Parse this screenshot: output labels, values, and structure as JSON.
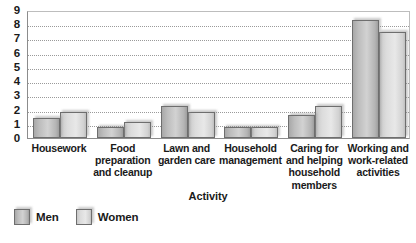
{
  "chart_data": {
    "type": "bar",
    "title": "",
    "subtitle": "",
    "xlabel": "Activity",
    "ylabel": "",
    "ylim": [
      0,
      9
    ],
    "ytick_labels": [
      "9",
      "8",
      "7",
      "6",
      "5",
      "4",
      "3",
      "2",
      "1",
      "0"
    ],
    "yticks": [
      9,
      8,
      7,
      6,
      5,
      4,
      3,
      2,
      1,
      0
    ],
    "grid": true,
    "grid_axis": "y",
    "grid_style": "dotted",
    "legend_position": "below-left",
    "categories": [
      "Housework",
      "Food preparation and cleanup",
      "Lawn and garden care",
      "Household management",
      "Caring for and helping household members",
      "Working and work-related activities"
    ],
    "category_label_lines": [
      [
        "Housework"
      ],
      [
        "Food",
        "preparation",
        "and cleanup"
      ],
      [
        "Lawn and",
        "garden care"
      ],
      [
        "Household",
        "management"
      ],
      [
        "Caring for",
        "and helping",
        "household",
        "members"
      ],
      [
        "Working and",
        "work-related",
        "activities"
      ]
    ],
    "series": [
      {
        "name": "Men",
        "color": "#bdbdbd",
        "values": [
          1.4,
          0.75,
          2.25,
          0.75,
          1.65,
          8.3
        ]
      },
      {
        "name": "Women",
        "color": "#dcdcdc",
        "values": [
          1.85,
          1.15,
          1.85,
          0.75,
          2.25,
          7.45
        ]
      }
    ]
  },
  "legend": {
    "items": [
      {
        "label": "Men",
        "swatch": "men"
      },
      {
        "label": "Women",
        "swatch": "women"
      }
    ]
  },
  "axis": {
    "x_title": "Activity"
  }
}
